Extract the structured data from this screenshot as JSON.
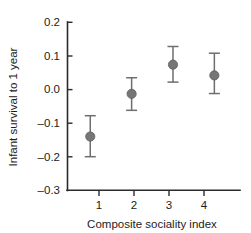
{
  "chart_data": {
    "type": "scatter",
    "title": "",
    "xlabel": "Composite sociality index",
    "ylabel": "Infant survival to 1 year",
    "x": [
      1,
      2,
      3,
      4
    ],
    "categories": [
      "1",
      "2",
      "3",
      "4"
    ],
    "values": [
      -0.14,
      -0.013,
      0.074,
      0.042
    ],
    "error_low": [
      -0.2,
      -0.062,
      0.022,
      -0.012
    ],
    "error_high": [
      -0.078,
      0.035,
      0.128,
      0.108
    ],
    "xtick_labels": [
      "1",
      "2",
      "3",
      "4"
    ],
    "ytick_labels": [
      "0.2",
      "0.1",
      "0.0",
      "–0.1",
      "–0.2",
      "–0.3"
    ],
    "ytick_values": [
      0.2,
      0.1,
      0.0,
      -0.1,
      -0.2,
      -0.3
    ],
    "xlim": [
      0.45,
      4.62
    ],
    "ylim": [
      -0.3,
      0.2
    ],
    "grid": false,
    "legend": false,
    "marker_color": "#767676",
    "errorbar_color": "#6e6e6e",
    "axis_color": "#2b2b2b",
    "background": "#ffffff",
    "series": [
      {
        "name": "Infant survival to 1 year",
        "points": [
          {
            "x": 1,
            "y": -0.14,
            "low": -0.2,
            "high": -0.078
          },
          {
            "x": 2,
            "y": -0.013,
            "low": -0.062,
            "high": 0.035
          },
          {
            "x": 3,
            "y": 0.074,
            "low": 0.022,
            "high": 0.128
          },
          {
            "x": 4,
            "y": 0.042,
            "low": -0.012,
            "high": 0.108
          }
        ]
      }
    ]
  }
}
